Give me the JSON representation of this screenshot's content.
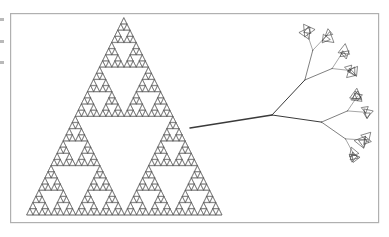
{
  "figure": {
    "caption": "",
    "background_color": "#ffffff",
    "frame": {
      "name": "figure-border",
      "x": 10,
      "y": 13,
      "width": 368,
      "height": 209,
      "stroke_color": "#b0b0b0",
      "stroke_width": 1.2
    },
    "stroke_color": "#555555",
    "panels": [
      {
        "name": "sierpinski-triangle",
        "label": "Sierpinski triangle",
        "depth": 5,
        "apex": [
          124,
          18
        ],
        "base_left": [
          27,
          215
        ],
        "base_right": [
          222,
          215
        ],
        "stroke_color": "#5a5a5a",
        "stroke_width": 0.55
      },
      {
        "name": "fractal-tree",
        "label": "Fractal tree with triangular leaves",
        "depth": 3,
        "trunk_start": [
          190,
          128
        ],
        "trunk_fork": [
          272,
          115
        ],
        "stroke_color": "#3a3a3a",
        "stroke_width": 0.8,
        "leaf_shape": "triangle",
        "leaf_clusters": 4
      }
    ],
    "edge_artifacts": [
      "",
      "",
      ""
    ]
  }
}
